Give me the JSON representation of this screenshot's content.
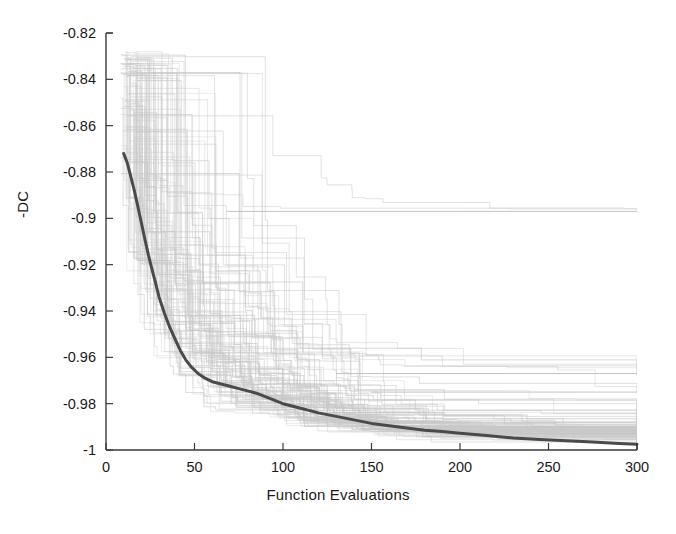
{
  "chart_data": {
    "type": "line",
    "title": "",
    "xlabel": "Function Evaluations",
    "ylabel": "-DC",
    "xlim": [
      0,
      300
    ],
    "ylim": [
      -1,
      -0.82
    ],
    "xticks": [
      0,
      50,
      100,
      150,
      200,
      250,
      300
    ],
    "xtick_labels": [
      "0",
      "50",
      "100",
      "150",
      "200",
      "250",
      "300"
    ],
    "yticks": [
      -1,
      -0.98,
      -0.96,
      -0.94,
      -0.92,
      -0.9,
      -0.88,
      -0.86,
      -0.84,
      -0.82
    ],
    "ytick_labels": [
      "-1",
      "-0.98",
      "-0.96",
      "-0.94",
      "-0.92",
      "-0.9",
      "-0.88",
      "-0.86",
      "-0.84",
      "-0.82"
    ],
    "grid": false,
    "legend": "none",
    "colors": {
      "runs": "#c8c8c8",
      "median": "#4a4a4a",
      "axis": "#3a3a3a",
      "background": "#ffffff"
    },
    "series": [
      {
        "name": "median",
        "style": "bold-dark",
        "x": [
          10,
          12,
          14,
          16,
          18,
          20,
          22,
          24,
          26,
          28,
          30,
          33,
          36,
          39,
          42,
          45,
          48,
          52,
          56,
          60,
          65,
          70,
          75,
          80,
          85,
          90,
          95,
          100,
          110,
          120,
          130,
          140,
          150,
          160,
          170,
          180,
          190,
          200,
          215,
          230,
          245,
          260,
          275,
          290,
          300
        ],
        "y": [
          -0.872,
          -0.876,
          -0.882,
          -0.888,
          -0.895,
          -0.902,
          -0.909,
          -0.916,
          -0.922,
          -0.928,
          -0.934,
          -0.941,
          -0.947,
          -0.952,
          -0.957,
          -0.961,
          -0.964,
          -0.967,
          -0.969,
          -0.9705,
          -0.9715,
          -0.9725,
          -0.9735,
          -0.9745,
          -0.9755,
          -0.977,
          -0.9785,
          -0.98,
          -0.982,
          -0.984,
          -0.9855,
          -0.987,
          -0.9885,
          -0.9895,
          -0.9905,
          -0.9915,
          -0.992,
          -0.9928,
          -0.9938,
          -0.9948,
          -0.9955,
          -0.996,
          -0.9965,
          -0.9972,
          -0.9975
        ]
      },
      {
        "name": "runs-envelope-upper",
        "style": "light-gray",
        "note": "best individual traces start near -0.828 at ~10 evaluations",
        "x": [
          10,
          300
        ],
        "y": [
          -0.828,
          -0.897
        ]
      },
      {
        "name": "plateau-line-a",
        "style": "light-gray",
        "x": [
          68,
          300
        ],
        "y": [
          -0.897,
          -0.897
        ]
      },
      {
        "name": "plateau-line-b",
        "style": "light-gray",
        "x": [
          130,
          300
        ],
        "y": [
          -0.967,
          -0.967
        ]
      },
      {
        "name": "plateau-line-c",
        "style": "light-gray",
        "x": [
          150,
          300
        ],
        "y": [
          -0.975,
          -0.975
        ]
      },
      {
        "name": "runs-bundle",
        "style": "light-gray",
        "note": "~100 staircase traces converging into a dense band between -0.993 and -1.0 after 200 evaluations",
        "x": [
          10,
          300
        ],
        "y": [
          -0.83,
          -0.999
        ]
      }
    ]
  },
  "axes": {
    "x_title": "Function Evaluations",
    "y_title": "-DC"
  }
}
